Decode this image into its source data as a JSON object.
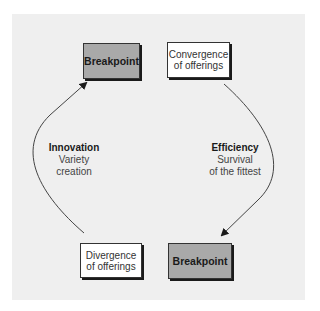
{
  "diagram": {
    "nodes": [
      {
        "id": "breakpoint_top",
        "label": "Breakpoint",
        "style": "gray"
      },
      {
        "id": "convergence",
        "label_lines": [
          "Convergence",
          "of offerings"
        ],
        "style": "white"
      },
      {
        "id": "divergence",
        "label_lines": [
          "Divergence",
          "of offerings"
        ],
        "style": "white"
      },
      {
        "id": "breakpoint_bottom",
        "label": "Breakpoint",
        "style": "gray"
      }
    ],
    "edges": [
      {
        "from": "divergence",
        "to": "breakpoint_top",
        "label": {
          "title": "Innovation",
          "lines": [
            "Variety",
            "creation"
          ]
        }
      },
      {
        "from": "convergence",
        "to": "breakpoint_bottom",
        "label": {
          "title": "Efficiency",
          "lines": [
            "Survival",
            "of the fittest"
          ]
        }
      }
    ],
    "colors": {
      "panel": "#efefef",
      "gray_box": "#a9a9a9",
      "white_box": "#ffffff",
      "shadow": "#1a1a1a",
      "arrow": "#333333"
    }
  }
}
